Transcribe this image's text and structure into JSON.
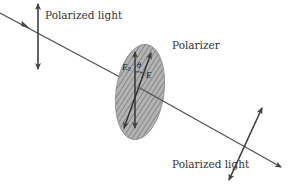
{
  "diagram": {
    "labels": {
      "input_light": "Polarized light",
      "polarizer": "Polarizer",
      "output_light": "Polarized light"
    },
    "vectors": {
      "incident_field": "E",
      "incident_field_subscript": "0",
      "transmitted_field": "E",
      "angle": "θ"
    },
    "colors": {
      "line": "#4a4a4a",
      "polarizer_fill": "#a9a9a9",
      "hatch": "#6f6f6f",
      "text": "#333333",
      "background": "#ffffff"
    }
  }
}
